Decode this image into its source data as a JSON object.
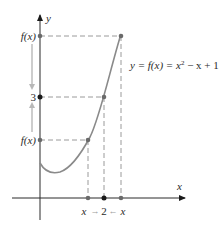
{
  "axes": {
    "x_label": "x",
    "y_label": "y"
  },
  "y_ticks": {
    "upper": "f(x)",
    "limit": "3",
    "lower": "f(x)"
  },
  "x_ticks": {
    "left": "x",
    "limit": "2",
    "right": "x",
    "left_arrow": "→",
    "right_arrow": "←"
  },
  "equation": "y = f(x) = x² − x + 1",
  "equation_parts": {
    "lhs": "y = f(x) = x",
    "exp": "2",
    "rhs": " − x + 1"
  },
  "colors": {
    "axis": "#2a2a2a",
    "curve": "#8a8a8a",
    "dash": "#9a9a9a",
    "arrow": "#b8b8b8",
    "point_dark": "#1a1a1a",
    "point_gray": "#6a6a6a"
  }
}
